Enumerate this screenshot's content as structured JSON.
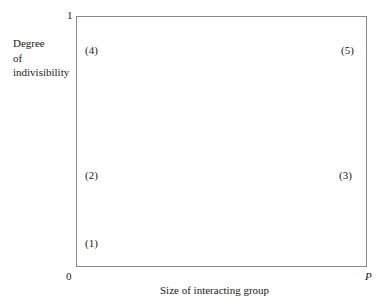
{
  "diagram": {
    "y_axis": {
      "label_lines": [
        "Degree",
        "of",
        "indivisibility"
      ],
      "top_tick": "1"
    },
    "x_axis": {
      "label": "Size of interacting group",
      "origin_tick": "0",
      "end_tick": "P"
    },
    "points": [
      {
        "label": "(1)",
        "position": "bottom-left"
      },
      {
        "label": "(2)",
        "position": "mid-left"
      },
      {
        "label": "(3)",
        "position": "mid-right"
      },
      {
        "label": "(4)",
        "position": "top-left"
      },
      {
        "label": "(5)",
        "position": "top-right"
      }
    ],
    "colors": {
      "frame": "#8a8a8a",
      "text": "#1a1a1a",
      "background": "#ffffff"
    }
  }
}
